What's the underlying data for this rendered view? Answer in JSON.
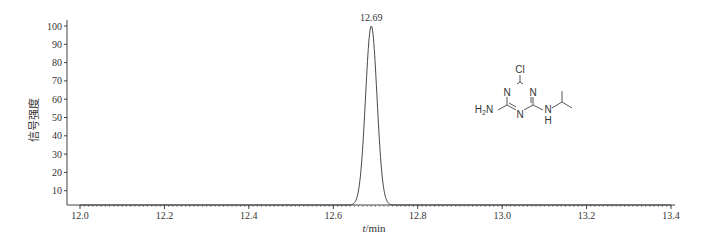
{
  "chart_data": {
    "type": "line",
    "title": "",
    "xlabel": "t/min",
    "xlabel_italic_part": "t",
    "xlabel_rest": "/min",
    "ylabel": "信号强度",
    "xlim": [
      12.0,
      13.4
    ],
    "ylim": [
      0,
      100
    ],
    "x_ticks": [
      "12.0",
      "12.2",
      "12.4",
      "12.6",
      "12.8",
      "13.0",
      "13.2",
      "13.4"
    ],
    "x_tick_values": [
      12.0,
      12.2,
      12.4,
      12.6,
      12.8,
      13.0,
      13.2,
      13.4
    ],
    "y_ticks": [
      "10",
      "20",
      "30",
      "40",
      "50",
      "60",
      "70",
      "80",
      "90",
      "100"
    ],
    "y_tick_values": [
      10,
      20,
      30,
      40,
      50,
      60,
      70,
      80,
      90,
      100
    ],
    "grid": false,
    "series": [
      {
        "name": "chromatogram",
        "peak": {
          "retention_time": 12.69,
          "height": 100,
          "label": "12.69",
          "start": 12.65,
          "end": 12.74
        },
        "x": [
          12.0,
          12.64,
          12.65,
          12.66,
          12.67,
          12.68,
          12.69,
          12.7,
          12.71,
          12.72,
          12.73,
          12.74,
          13.4
        ],
        "y": [
          0,
          0,
          1,
          8,
          35,
          80,
          100,
          80,
          35,
          8,
          1,
          0,
          0
        ]
      }
    ],
    "annotations": [
      {
        "type": "peak_label",
        "text": "12.69",
        "x": 12.69,
        "y": 100
      },
      {
        "type": "structure",
        "description": "Deisopropylatrazine-like triazine structure: 6-chloro-N-isopropyl-1,3,5-triazine-2,4-diamine",
        "atoms": [
          "Cl",
          "N",
          "N",
          "N",
          "H2N",
          "N",
          "H"
        ]
      }
    ]
  },
  "structure": {
    "cl": "Cl",
    "n_top_left": "N",
    "n_top_right": "N",
    "n_bottom": "N",
    "nh2": "H",
    "nh2_sub": "2",
    "nh2_n": "N",
    "nh_n": "N",
    "nh_h": "H"
  }
}
